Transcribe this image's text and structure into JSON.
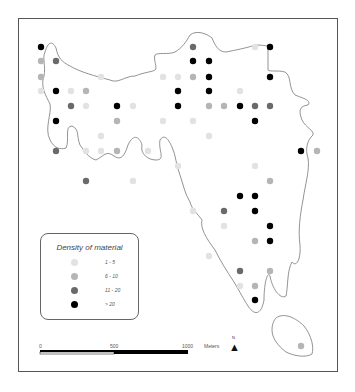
{
  "map": {
    "frame": {
      "x": 18,
      "y": 18,
      "width": 320,
      "height": 354
    },
    "outline_color": "#777777",
    "legend": {
      "title": "Density of material",
      "items": [
        {
          "label": "1 - 5",
          "color": "#e2e2e2"
        },
        {
          "label": "6 - 10",
          "color": "#b5b5b5"
        },
        {
          "label": "11 - 20",
          "color": "#6a6a6a"
        },
        {
          "label": "> 20",
          "color": "#000000"
        }
      ]
    },
    "scale_bar": {
      "ticks": [
        "0",
        "500",
        "1000"
      ],
      "unit": "Meters"
    },
    "north_arrow": {
      "label": "N",
      "glyph": "north-arrow-icon"
    },
    "classes": {
      "c1": "#e2e2e2",
      "c2": "#b5b5b5",
      "c3": "#6a6a6a",
      "c4": "#000000"
    },
    "points": [
      {
        "x": 41,
        "y": 47,
        "c": "c4"
      },
      {
        "x": 193,
        "y": 47,
        "c": "c3"
      },
      {
        "x": 255,
        "y": 47,
        "c": "c1"
      },
      {
        "x": 270,
        "y": 47,
        "c": "c4"
      },
      {
        "x": 41,
        "y": 61,
        "c": "c2"
      },
      {
        "x": 56,
        "y": 61,
        "c": "c3"
      },
      {
        "x": 193,
        "y": 61,
        "c": "c4"
      },
      {
        "x": 209,
        "y": 61,
        "c": "c4"
      },
      {
        "x": 41,
        "y": 77,
        "c": "c2"
      },
      {
        "x": 101,
        "y": 77,
        "c": "c1"
      },
      {
        "x": 163,
        "y": 77,
        "c": "c1"
      },
      {
        "x": 178,
        "y": 77,
        "c": "c1"
      },
      {
        "x": 193,
        "y": 77,
        "c": "c2"
      },
      {
        "x": 209,
        "y": 77,
        "c": "c4"
      },
      {
        "x": 270,
        "y": 77,
        "c": "c4"
      },
      {
        "x": 41,
        "y": 91,
        "c": "c1"
      },
      {
        "x": 56,
        "y": 91,
        "c": "c4"
      },
      {
        "x": 71,
        "y": 91,
        "c": "c1"
      },
      {
        "x": 86,
        "y": 91,
        "c": "c2"
      },
      {
        "x": 178,
        "y": 91,
        "c": "c4"
      },
      {
        "x": 209,
        "y": 91,
        "c": "c4"
      },
      {
        "x": 240,
        "y": 91,
        "c": "c1"
      },
      {
        "x": 71,
        "y": 106,
        "c": "c3"
      },
      {
        "x": 86,
        "y": 106,
        "c": "c1"
      },
      {
        "x": 117,
        "y": 106,
        "c": "c4"
      },
      {
        "x": 133,
        "y": 106,
        "c": "c1"
      },
      {
        "x": 178,
        "y": 106,
        "c": "c4"
      },
      {
        "x": 209,
        "y": 106,
        "c": "c2"
      },
      {
        "x": 224,
        "y": 106,
        "c": "c2"
      },
      {
        "x": 240,
        "y": 106,
        "c": "c4"
      },
      {
        "x": 255,
        "y": 106,
        "c": "c3"
      },
      {
        "x": 270,
        "y": 106,
        "c": "c3"
      },
      {
        "x": 56,
        "y": 121,
        "c": "c4"
      },
      {
        "x": 117,
        "y": 121,
        "c": "c2"
      },
      {
        "x": 163,
        "y": 121,
        "c": "c1"
      },
      {
        "x": 193,
        "y": 121,
        "c": "c1"
      },
      {
        "x": 255,
        "y": 121,
        "c": "c4"
      },
      {
        "x": 101,
        "y": 136,
        "c": "c1"
      },
      {
        "x": 209,
        "y": 136,
        "c": "c1"
      },
      {
        "x": 56,
        "y": 151,
        "c": "c3"
      },
      {
        "x": 86,
        "y": 151,
        "c": "c1"
      },
      {
        "x": 101,
        "y": 151,
        "c": "c1"
      },
      {
        "x": 117,
        "y": 151,
        "c": "c2"
      },
      {
        "x": 148,
        "y": 151,
        "c": "c1"
      },
      {
        "x": 301,
        "y": 151,
        "c": "c4"
      },
      {
        "x": 317,
        "y": 151,
        "c": "c2"
      },
      {
        "x": 178,
        "y": 166,
        "c": "c1"
      },
      {
        "x": 255,
        "y": 166,
        "c": "c1"
      },
      {
        "x": 86,
        "y": 181,
        "c": "c3"
      },
      {
        "x": 133,
        "y": 181,
        "c": "c1"
      },
      {
        "x": 270,
        "y": 181,
        "c": "c2"
      },
      {
        "x": 240,
        "y": 196,
        "c": "c4"
      },
      {
        "x": 255,
        "y": 196,
        "c": "c4"
      },
      {
        "x": 193,
        "y": 211,
        "c": "c1"
      },
      {
        "x": 224,
        "y": 211,
        "c": "c3"
      },
      {
        "x": 255,
        "y": 211,
        "c": "c4"
      },
      {
        "x": 224,
        "y": 226,
        "c": "c1"
      },
      {
        "x": 270,
        "y": 226,
        "c": "c4"
      },
      {
        "x": 255,
        "y": 241,
        "c": "c2"
      },
      {
        "x": 270,
        "y": 241,
        "c": "c4"
      },
      {
        "x": 209,
        "y": 256,
        "c": "c1"
      },
      {
        "x": 240,
        "y": 271,
        "c": "c3"
      },
      {
        "x": 270,
        "y": 271,
        "c": "c2"
      },
      {
        "x": 240,
        "y": 286,
        "c": "c1"
      },
      {
        "x": 255,
        "y": 286,
        "c": "c2"
      },
      {
        "x": 255,
        "y": 300,
        "c": "c4"
      },
      {
        "x": 301,
        "y": 346,
        "c": "c2"
      }
    ]
  }
}
